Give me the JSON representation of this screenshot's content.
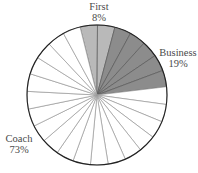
{
  "chart_data": {
    "type": "pie",
    "title": "",
    "categories": [
      "First",
      "Business",
      "Coach"
    ],
    "values": [
      8,
      19,
      73
    ],
    "value_labels": [
      "8%",
      "19%",
      "73%"
    ],
    "colors": [
      "#b9b9b9",
      "#8c8c8c",
      "#ffffff"
    ],
    "subdivisions": [
      2,
      5,
      18
    ],
    "start_angle_deg": -14,
    "direction": "clockwise",
    "legend": "none",
    "label_positions": {
      "First": "top",
      "Business": "right",
      "Coach": "left"
    }
  },
  "labels": {
    "first_name": "First",
    "first_pct": "8%",
    "business_name": "Business",
    "business_pct": "19%",
    "coach_name": "Coach",
    "coach_pct": "73%"
  }
}
